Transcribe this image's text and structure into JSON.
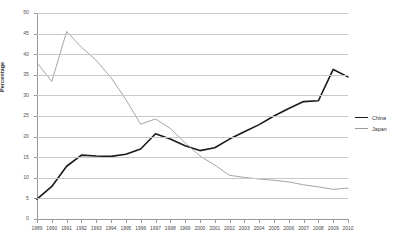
{
  "chart_data": {
    "type": "line",
    "title": "",
    "xlabel": "",
    "ylabel": "Percentage",
    "ylim": [
      0,
      50
    ],
    "ytick_step": 5,
    "yticks": [
      0,
      5,
      10,
      15,
      20,
      25,
      30,
      35,
      40,
      45,
      50
    ],
    "grid": true,
    "legend_position": "right",
    "categories": [
      "1989",
      "1990",
      "1991",
      "1992",
      "1993",
      "1994",
      "1995",
      "1996",
      "1997",
      "1998",
      "1999",
      "2000",
      "2001",
      "2002",
      "2003",
      "2004",
      "2005",
      "2006",
      "2007",
      "2008",
      "2009",
      "2010"
    ],
    "series": [
      {
        "name": "China",
        "color": "#1a1a1a",
        "values": [
          4.8,
          7.9,
          12.8,
          15.5,
          15.3,
          15.2,
          15.7,
          17.0,
          20.7,
          19.4,
          17.8,
          16.6,
          17.3,
          19.4,
          21.2,
          22.9,
          25.0,
          26.8,
          28.5,
          28.7,
          36.3,
          34.5
        ]
      },
      {
        "name": "Japan",
        "color": "#9b9b9b",
        "values": [
          37.9,
          33.4,
          45.5,
          41.7,
          38.5,
          34.3,
          29.0,
          23.0,
          24.3,
          22.0,
          18.5,
          15.3,
          13.1,
          10.6,
          10.1,
          9.7,
          9.4,
          9.0,
          8.3,
          7.8,
          7.2,
          7.5
        ]
      }
    ]
  },
  "legend": {
    "items": [
      {
        "label": "China"
      },
      {
        "label": "Japan"
      }
    ]
  }
}
